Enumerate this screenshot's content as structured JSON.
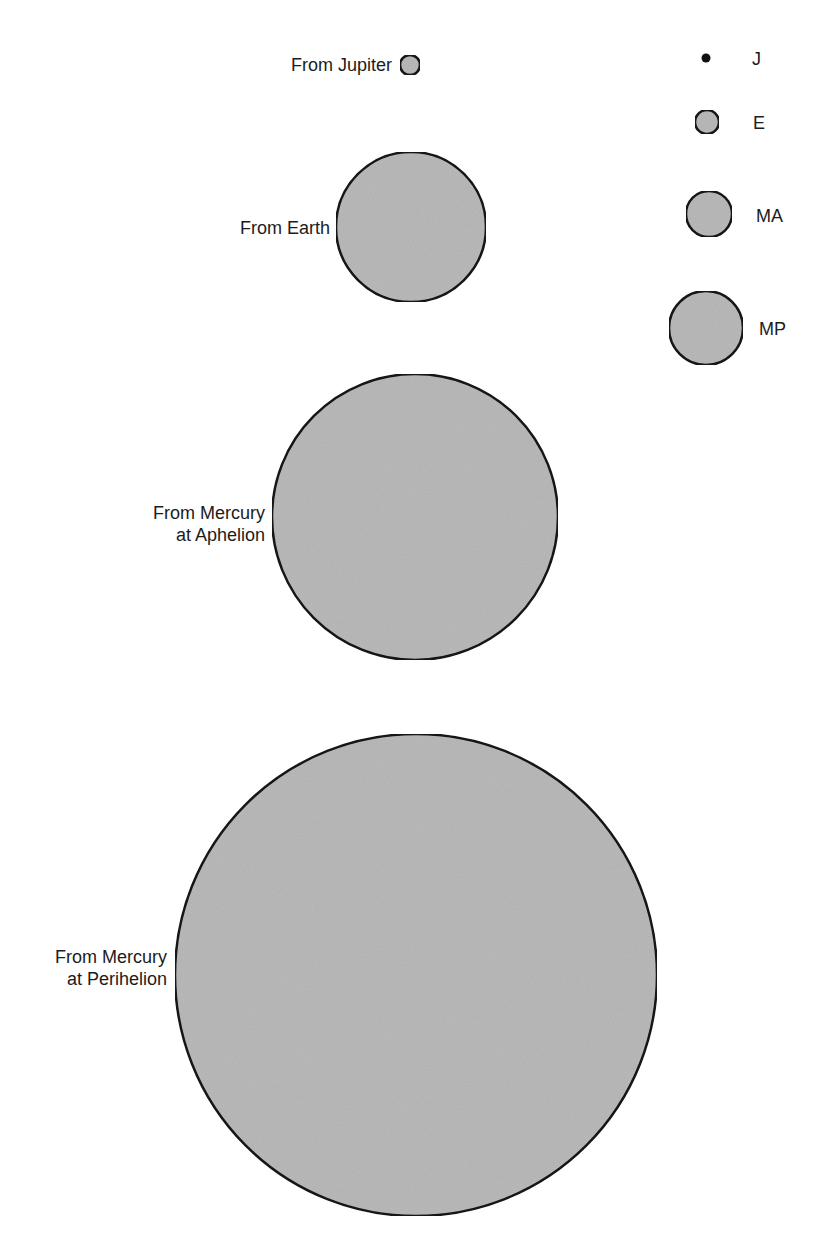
{
  "diagram": {
    "fill_color": "#b9b9b9",
    "stroke_color": "#141414",
    "views": [
      {
        "id": "jupiter",
        "label_lines": [
          "From Jupiter"
        ],
        "cx": 410,
        "cy": 65,
        "r": 10
      },
      {
        "id": "earth",
        "label_lines": [
          "From Earth"
        ],
        "cx": 411,
        "cy": 227,
        "r": 75
      },
      {
        "id": "mercury-aphelion",
        "label_lines": [
          "From Mercury",
          "at Aphelion"
        ],
        "cx": 415,
        "cy": 517,
        "r": 143
      },
      {
        "id": "mercury-perihelion",
        "label_lines": [
          "From Mercury",
          "at Perihelion"
        ],
        "cx": 416,
        "cy": 975,
        "r": 241
      }
    ],
    "legend": [
      {
        "key": "J",
        "cx": 706,
        "cy": 58,
        "r": 4.5,
        "filled_dark": true
      },
      {
        "key": "E",
        "cx": 707,
        "cy": 122,
        "r": 12
      },
      {
        "key": "MA",
        "cx": 709,
        "cy": 214,
        "r": 23
      },
      {
        "key": "MP",
        "cx": 706,
        "cy": 328,
        "r": 37
      }
    ]
  }
}
